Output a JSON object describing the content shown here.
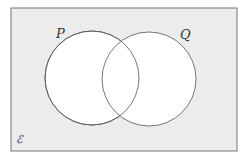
{
  "diagram": {
    "type": "venn",
    "universal_set_label": "ℰ",
    "sets": [
      {
        "label": "P"
      },
      {
        "label": "Q"
      }
    ],
    "colors": {
      "universe_fill": "#ececec",
      "set_fill": "#ffffff",
      "stroke": "#555555"
    }
  }
}
